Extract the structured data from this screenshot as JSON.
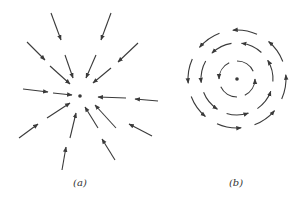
{
  "figure": {
    "panels": [
      {
        "id": "a",
        "label": "(a)",
        "description": "Radial field: arrows pointing inward toward a central point charge",
        "center": [
          80,
          96
        ],
        "label_pos": [
          80,
          177
        ],
        "arrows": [
          [
            51,
            13,
            61,
            40
          ],
          [
            111,
            13,
            101,
            40
          ],
          [
            27,
            42,
            45,
            60
          ],
          [
            138,
            43,
            118,
            62
          ],
          [
            50,
            66,
            70,
            84
          ],
          [
            65,
            55,
            73,
            78
          ],
          [
            96,
            55,
            86,
            78
          ],
          [
            111,
            68,
            93,
            83
          ],
          [
            23,
            89,
            48,
            92
          ],
          [
            53,
            93,
            72,
            95
          ],
          [
            158,
            101,
            135,
            99
          ],
          [
            126,
            98,
            98,
            97
          ],
          [
            47,
            118,
            70,
            103
          ],
          [
            19,
            138,
            38,
            124
          ],
          [
            70,
            138,
            76,
            113
          ],
          [
            62,
            170,
            66,
            147
          ],
          [
            98,
            128,
            85,
            107
          ],
          [
            116,
            128,
            95,
            105
          ],
          [
            152,
            136,
            129,
            124
          ],
          [
            115,
            160,
            102,
            139
          ]
        ]
      },
      {
        "id": "b",
        "label": "(b)",
        "description": "Circulating field: dashed concentric circles with counter-clockwise arrows around a central point",
        "center": [
          237,
          79
        ],
        "label_pos": [
          236,
          177
        ],
        "rings": [
          {
            "radius": 18,
            "segments": 4
          },
          {
            "radius": 36,
            "segments": 7
          },
          {
            "radius": 49,
            "segments": 8
          }
        ],
        "direction": "counter-clockwise"
      }
    ],
    "colors": {
      "stroke": "#3a3a3a",
      "background": "#ffffff"
    }
  }
}
